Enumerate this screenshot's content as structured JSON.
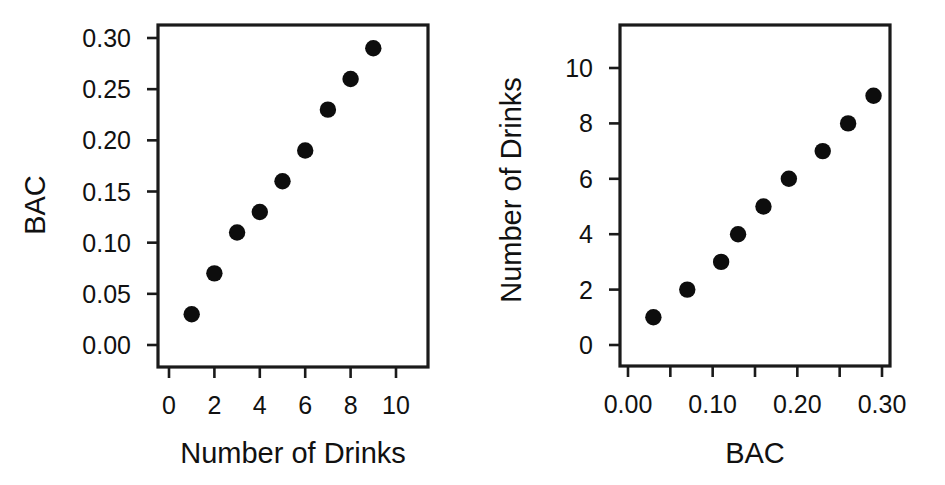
{
  "figure": {
    "background": "#ffffff",
    "marker_color": "#0d0d0d",
    "axis_color": "#1a1a1a",
    "panel_count": 2
  },
  "chart_data": [
    {
      "type": "scatter",
      "title": "",
      "xlabel": "Number of Drinks",
      "ylabel": "BAC",
      "xlim": [
        -0.45,
        11.1
      ],
      "ylim": [
        -0.012,
        0.314
      ],
      "xticks": [
        0,
        2,
        4,
        6,
        8,
        10
      ],
      "xticklabels": [
        "0",
        "2",
        "4",
        "6",
        "8",
        "10"
      ],
      "yticks": [
        0.0,
        0.05,
        0.1,
        0.15,
        0.2,
        0.25,
        0.3
      ],
      "yticklabels": [
        "0.00",
        "0.05",
        "0.10",
        "0.15",
        "0.20",
        "0.25",
        "0.30"
      ],
      "grid": false,
      "legend": false,
      "x": [
        1,
        2,
        3,
        4,
        5,
        6,
        7,
        8,
        9
      ],
      "y": [
        0.03,
        0.07,
        0.11,
        0.13,
        0.16,
        0.19,
        0.23,
        0.26,
        0.29
      ]
    },
    {
      "type": "scatter",
      "title": "",
      "xlabel": "BAC",
      "ylabel": "Number of Drinks",
      "xlim": [
        -0.0155,
        0.3155
      ],
      "ylim": [
        -0.45,
        11.6
      ],
      "xticks": [
        0.0,
        0.05,
        0.1,
        0.15,
        0.2,
        0.25,
        0.3
      ],
      "xticklabels": [
        "0.00",
        "",
        "0.10",
        "",
        "0.20",
        "",
        "0.30"
      ],
      "yticks": [
        0,
        2,
        4,
        6,
        8,
        10
      ],
      "yticklabels": [
        "0",
        "2",
        "4",
        "6",
        "8",
        "10"
      ],
      "grid": false,
      "legend": false,
      "x": [
        0.03,
        0.07,
        0.11,
        0.13,
        0.16,
        0.19,
        0.23,
        0.26,
        0.29
      ],
      "y": [
        1,
        2,
        3,
        4,
        5,
        6,
        7,
        8,
        9
      ]
    }
  ]
}
